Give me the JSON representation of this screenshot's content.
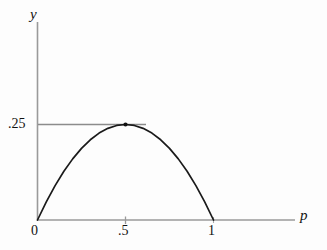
{
  "chart_data": {
    "type": "line",
    "title": "",
    "subtitle": "",
    "xlabel": "p",
    "ylabel": "y",
    "xlim": [
      0,
      1.44
    ],
    "ylim": [
      0,
      0.2825
    ],
    "grid": false,
    "legend": null,
    "function": "y = p(1 - p)",
    "x": [
      0,
      0.05,
      0.1,
      0.15,
      0.2,
      0.25,
      0.3,
      0.35,
      0.4,
      0.45,
      0.5,
      0.55,
      0.6,
      0.65,
      0.7,
      0.75,
      0.8,
      0.85,
      0.9,
      0.95,
      1
    ],
    "values": [
      0,
      0.0475,
      0.09,
      0.1275,
      0.16,
      0.1875,
      0.21,
      0.2275,
      0.24,
      0.2475,
      0.25,
      0.2475,
      0.24,
      0.2275,
      0.21,
      0.1875,
      0.16,
      0.1275,
      0.09,
      0.0475,
      0
    ],
    "xticks": [
      0,
      0.5,
      1
    ],
    "xticklabels": [
      "0",
      ".5",
      "1"
    ],
    "yticks": [
      0.25
    ],
    "yticklabels": [
      ".25"
    ],
    "annotations": [
      {
        "name": "maximum-point",
        "x": 0.5,
        "y": 0.25,
        "marker": "dot",
        "guideline": "horizontal from y-axis to x=0.62 at y=0.25"
      }
    ],
    "colors": {
      "curve": "#1a1a1a",
      "axis": "#9a9a9a",
      "guideline": "#8c8c8c",
      "marker": "#111111",
      "background": "#fdfdfd",
      "text": "#111111"
    }
  },
  "labels": {
    "y_axis": "y",
    "x_axis": "p",
    "x_tick_0": "0",
    "x_tick_half": ".5",
    "x_tick_one": "1",
    "y_tick_quarter": ".25"
  }
}
